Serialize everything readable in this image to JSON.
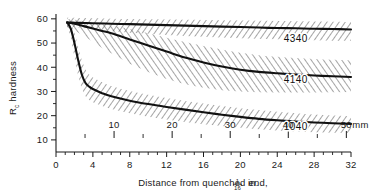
{
  "chart_data": {
    "type": "line",
    "title": "",
    "subtitle": "",
    "xlabel": "Distance from quenched end, 1/16 in.",
    "xlabel_prefix": "Distance from quenched end,",
    "xlabel_frac_numerator": "1",
    "xlabel_frac_denominator": "16",
    "xlabel_suffix": "in.",
    "ylabel": "R c hardness",
    "ylabel_prefix": "R",
    "ylabel_subscript": "c",
    "ylabel_suffix": " hardness",
    "xlim": [
      0,
      32
    ],
    "ylim": [
      5,
      62
    ],
    "grid": false,
    "legend_position": "inline-annotations",
    "x_ticks": [
      0,
      4,
      8,
      12,
      16,
      20,
      24,
      28,
      32
    ],
    "x_tick_labels": [
      "0",
      "4",
      "8",
      "12",
      "16",
      "20",
      "24",
      "28",
      "32"
    ],
    "x_minor_step": 1,
    "y_ticks": [
      10,
      20,
      30,
      40,
      50,
      60
    ],
    "y_tick_labels": [
      "10",
      "20",
      "30",
      "40",
      "50",
      "60"
    ],
    "y_minor_step": 5,
    "secondary_axis": {
      "label": "mm",
      "unit_label": "mm",
      "ticks_mm": [
        10,
        20,
        30,
        40,
        50
      ],
      "tick_labels": [
        "10",
        "20",
        "30",
        "40",
        "50"
      ],
      "minor_step_mm": 5,
      "mm_per_sixteenth": 1.5875
    },
    "series": [
      {
        "name": "4340",
        "label": "4340",
        "label_x": 26.0,
        "label_y": 50.5,
        "x": [
          1.2,
          2,
          3,
          4,
          6,
          8,
          10,
          12,
          14,
          16,
          18,
          20,
          22,
          24,
          26,
          28,
          30,
          32
        ],
        "values": [
          58.5,
          58.4,
          58.3,
          58.2,
          58.0,
          57.8,
          57.6,
          57.4,
          57.2,
          57.0,
          56.8,
          56.6,
          56.4,
          56.2,
          56.1,
          55.9,
          55.8,
          55.6
        ],
        "band_upper": [
          60.5,
          60.4,
          60.3,
          60.2,
          60.0,
          59.9,
          59.8,
          59.7,
          59.6,
          59.5,
          59.4,
          59.3,
          59.2,
          59.1,
          59.0,
          58.9,
          58.8,
          58.7
        ],
        "band_lower": [
          57.0,
          56.6,
          56.2,
          55.8,
          55.0,
          54.3,
          53.8,
          53.3,
          52.9,
          52.6,
          52.3,
          52.0,
          51.8,
          51.6,
          51.4,
          51.2,
          51.0,
          50.9
        ]
      },
      {
        "name": "4140",
        "label": "4140",
        "label_x": 26.0,
        "label_y": 33.5,
        "x": [
          1.2,
          2,
          3,
          4,
          5,
          6,
          8,
          10,
          12,
          14,
          16,
          18,
          20,
          22,
          24,
          26,
          28,
          30,
          32
        ],
        "values": [
          58.5,
          58.0,
          57.0,
          56.0,
          55.0,
          54.0,
          51.5,
          49.0,
          46.5,
          44.0,
          42.0,
          40.3,
          39.0,
          38.1,
          37.5,
          37.0,
          36.6,
          36.3,
          36.0
        ],
        "band_upper": [
          60.0,
          59.6,
          59.0,
          58.4,
          57.8,
          57.2,
          55.8,
          54.0,
          52.2,
          50.4,
          48.8,
          47.3,
          46.0,
          45.0,
          44.3,
          43.8,
          43.4,
          43.1,
          42.9
        ],
        "band_lower": [
          56.5,
          55.2,
          53.0,
          50.5,
          48.0,
          45.8,
          41.5,
          38.0,
          35.2,
          33.0,
          31.5,
          30.5,
          30.0,
          29.7,
          29.6,
          29.6,
          29.6,
          29.7,
          29.8
        ]
      },
      {
        "name": "1040",
        "label": "1040",
        "label_x": 26.0,
        "label_y": 14.0,
        "x": [
          1.2,
          1.6,
          2.0,
          2.4,
          2.8,
          3.2,
          3.6,
          4.0,
          5.0,
          6.0,
          8.0,
          10.0,
          12.0,
          14.0,
          16.0,
          18.0,
          20.0,
          22.0,
          24.0,
          26.0,
          28.0,
          30.0,
          32.0
        ],
        "values": [
          58.5,
          56.0,
          50.0,
          43.0,
          37.0,
          33.5,
          32.0,
          31.0,
          29.3,
          28.0,
          26.2,
          24.8,
          23.6,
          22.5,
          21.4,
          20.4,
          19.5,
          18.7,
          18.1,
          17.6,
          17.2,
          16.9,
          16.6
        ],
        "band_upper": [
          60.0,
          58.5,
          54.5,
          48.5,
          43.0,
          39.0,
          37.0,
          35.8,
          33.8,
          32.3,
          30.2,
          28.6,
          27.3,
          26.1,
          25.0,
          24.0,
          23.1,
          22.3,
          21.6,
          21.0,
          20.5,
          20.1,
          19.8
        ],
        "band_lower": [
          57.0,
          52.5,
          44.0,
          36.5,
          31.0,
          28.0,
          26.5,
          25.6,
          24.0,
          22.8,
          21.0,
          19.6,
          18.4,
          17.4,
          16.5,
          15.7,
          15.0,
          14.4,
          13.9,
          13.5,
          13.2,
          13.0,
          12.8
        ]
      }
    ],
    "band_style": "diagonal-hatch",
    "band_color": "#555555",
    "curve_color": "#111111",
    "axis_color": "#1a1a1a",
    "background_color": "#ffffff"
  }
}
